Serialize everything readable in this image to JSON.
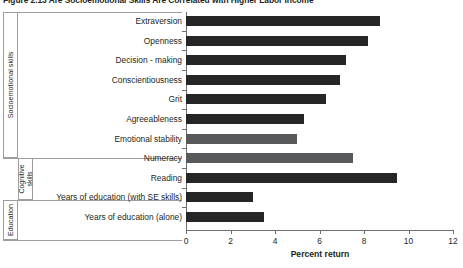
{
  "figure": {
    "title": "Figure 2.13  Are Socioemotional Skills Are Correlated with Higher Labor Income"
  },
  "groups": [
    {
      "name": "socioemotional",
      "label": "Socioemotional skills"
    },
    {
      "name": "cognitive",
      "label": "Cognitive skills"
    },
    {
      "name": "education",
      "label": "Education"
    }
  ],
  "chart_data": {
    "type": "bar",
    "orientation": "horizontal",
    "title": "Figure 2.13  Are Socioemotional Skills Are Correlated with Higher Labor Income",
    "xlabel": "Percent return",
    "ylabel": "",
    "xlim": [
      0,
      12
    ],
    "xticks": [
      0,
      2,
      4,
      6,
      8,
      10,
      12
    ],
    "xticklabels": [
      "0",
      "2",
      "4",
      "6",
      "8",
      "10",
      "12"
    ],
    "grid": false,
    "legend": false,
    "categories": [
      "Extraversion",
      "Openness",
      "Decision - making",
      "Conscientiousness",
      "Grit",
      "Agreeableness",
      "Emotional stability",
      "Numeracy",
      "Reading",
      "Years of education (with SE skills)",
      "Years of education (alone)"
    ],
    "values": [
      8.7,
      8.2,
      7.2,
      6.9,
      6.3,
      5.3,
      5.0,
      7.5,
      9.5,
      3.0,
      3.5
    ],
    "bar_colors": [
      "#262626",
      "#262626",
      "#262626",
      "#262626",
      "#262626",
      "#262626",
      "#58595b",
      "#58595b",
      "#262626",
      "#262626",
      "#262626"
    ],
    "category_groups": [
      "socioemotional",
      "socioemotional",
      "socioemotional",
      "socioemotional",
      "socioemotional",
      "socioemotional",
      "socioemotional",
      "cognitive",
      "cognitive",
      "education",
      "education"
    ]
  },
  "colors": {
    "dark_bar": "#262626",
    "gray_bar": "#58595b",
    "axis": "#6d6e71",
    "rule": "#9d9d9d",
    "text": "#231f20",
    "background": "#ffffff"
  }
}
